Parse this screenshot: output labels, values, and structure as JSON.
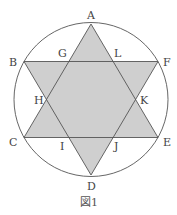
{
  "figure": {
    "caption": "図1",
    "colors": {
      "fill": "#cfcfcf",
      "stroke": "#555555",
      "background": "#ffffff"
    },
    "circle": {
      "cx": 91,
      "cy": 99.5,
      "r": 77
    },
    "points": {
      "A": "A",
      "B": "B",
      "C": "C",
      "D": "D",
      "E": "E",
      "F": "F",
      "G": "G",
      "H": "H",
      "I": "I",
      "J": "J",
      "K": "K",
      "L": "L"
    },
    "triangles": [
      {
        "name": "ACE",
        "vertices": [
          "A",
          "C",
          "E"
        ]
      },
      {
        "name": "BDF",
        "vertices": [
          "B",
          "D",
          "F"
        ]
      }
    ]
  }
}
